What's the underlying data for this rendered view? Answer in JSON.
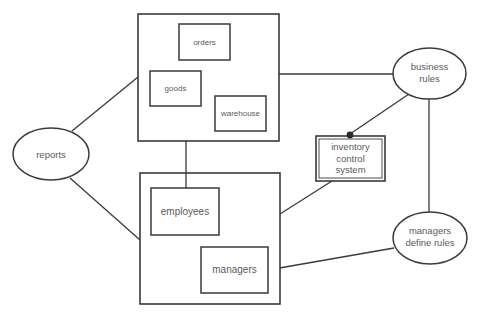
{
  "colors": {
    "stroke": "#3a3a3a",
    "text": "#5a5a5a",
    "background": "#ffffff"
  },
  "nodes": {
    "top_group": {
      "type": "container"
    },
    "orders": {
      "label": "orders"
    },
    "goods": {
      "label": "goods"
    },
    "warehouse": {
      "label": "warehouse"
    },
    "bottom_group": {
      "type": "container"
    },
    "employees": {
      "label": "employees"
    },
    "managers": {
      "label": "managers"
    },
    "inventory": {
      "lines": [
        "inventory",
        "control",
        "system"
      ]
    },
    "reports": {
      "label": "reports"
    },
    "business_rules": {
      "lines": [
        "business",
        "rules"
      ]
    },
    "managers_define_rules": {
      "lines": [
        "managers",
        "define rules"
      ]
    }
  },
  "edges": [
    {
      "from": "reports",
      "to": "top_group"
    },
    {
      "from": "reports",
      "to": "bottom_group"
    },
    {
      "from": "top_group",
      "to": "business_rules"
    },
    {
      "from": "top_group",
      "to": "employees"
    },
    {
      "from": "inventory",
      "to": "business_rules",
      "marker": "dot"
    },
    {
      "from": "inventory",
      "to": "bottom_group"
    },
    {
      "from": "business_rules",
      "to": "managers_define_rules"
    },
    {
      "from": "managers",
      "to": "managers_define_rules"
    }
  ]
}
